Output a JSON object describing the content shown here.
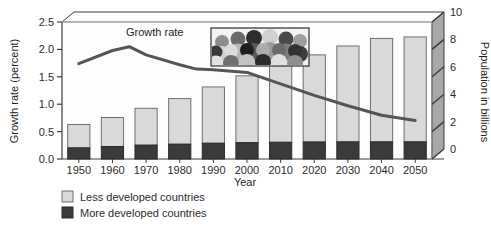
{
  "figure": {
    "left_axis_title": "Growth rate (percent)",
    "right_axis_title": "Population in billions",
    "x_axis_title": "Year",
    "series_annotation": "Growth rate",
    "inset_name": "crowd-photo"
  },
  "legend": {
    "items": [
      {
        "label": "Less developed countries",
        "color": "#d9d9d9"
      },
      {
        "label": "More developed countries",
        "color": "#3a3a3a"
      }
    ]
  },
  "left_axis": {
    "ticks": [
      "0.0",
      "0.5",
      "1.0",
      "1.5",
      "2.0",
      "2.5"
    ],
    "min": 0.0,
    "max": 2.5
  },
  "right_axis": {
    "ticks": [
      "0",
      "2",
      "4",
      "6",
      "8",
      "10"
    ],
    "min": 0,
    "max": 10
  },
  "x_axis": {
    "ticks": [
      "1950",
      "1960",
      "1970",
      "1980",
      "1990",
      "2000",
      "2010",
      "2020",
      "2030",
      "2040",
      "2050"
    ]
  },
  "colors": {
    "less_developed": "#d9d9d9",
    "more_developed": "#3a3a3a",
    "line": "#555555",
    "wall": "#a8a8a8",
    "plot_bg": "#fdfdfd",
    "frame": "#3c3c3c"
  },
  "chart_data": {
    "type": "bar",
    "title": "",
    "subtitle": "",
    "xlabel": "Year",
    "ylabel": "Growth rate (percent)",
    "y2label": "Population in billions",
    "categories": [
      "1950",
      "1960",
      "1970",
      "1980",
      "1990",
      "2000",
      "2010",
      "2020",
      "2030",
      "2040",
      "2050"
    ],
    "ylim": [
      0,
      2.5
    ],
    "y2lim": [
      0,
      10
    ],
    "grid": false,
    "legend_position": "bottom-left",
    "series": [
      {
        "name": "More developed countries",
        "type": "bar",
        "stack": "population",
        "axis": "right",
        "unit": "billions",
        "values": [
          0.81,
          0.91,
          1.01,
          1.08,
          1.15,
          1.19,
          1.22,
          1.24,
          1.25,
          1.25,
          1.25
        ]
      },
      {
        "name": "Less developed countries",
        "type": "bar",
        "stack": "population",
        "axis": "right",
        "unit": "billions",
        "values": [
          1.71,
          2.12,
          2.69,
          3.33,
          4.11,
          4.88,
          5.63,
          6.36,
          7.0,
          7.55,
          7.66
        ]
      },
      {
        "name": "Total population",
        "type": "bar-total",
        "axis": "right",
        "unit": "billions",
        "values": [
          2.52,
          3.03,
          3.7,
          4.41,
          5.26,
          6.07,
          6.85,
          7.6,
          8.25,
          8.8,
          8.91
        ]
      },
      {
        "name": "Growth rate",
        "type": "line",
        "axis": "left",
        "unit": "percent",
        "x": [
          "1950",
          "1960",
          "1965",
          "1970",
          "1980",
          "1985",
          "1990",
          "2000",
          "2010",
          "2020",
          "2030",
          "2040",
          "2050"
        ],
        "values": [
          1.74,
          1.98,
          2.05,
          1.9,
          1.72,
          1.64,
          1.63,
          1.58,
          1.37,
          1.16,
          0.97,
          0.8,
          0.7
        ]
      }
    ],
    "annotations": [
      {
        "text": "Growth rate",
        "x": "1975",
        "y": 2.22
      }
    ]
  }
}
